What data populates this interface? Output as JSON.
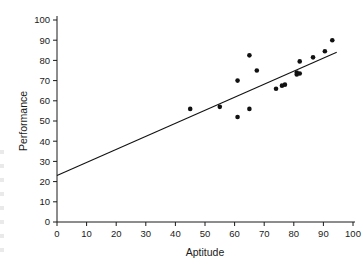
{
  "chart_data": {
    "type": "scatter",
    "title": "",
    "xlabel": "Aptitude",
    "ylabel": "Performance",
    "xlim": [
      0,
      100
    ],
    "ylim": [
      0,
      100
    ],
    "xticks": [
      0,
      10,
      20,
      30,
      40,
      50,
      60,
      70,
      80,
      90,
      100
    ],
    "yticks": [
      0,
      10,
      20,
      30,
      40,
      50,
      60,
      70,
      80,
      90,
      100
    ],
    "grid": false,
    "legend": null,
    "marker_color": "#111111",
    "line_color": "#111111",
    "points": [
      {
        "x": 45.0,
        "y": 56.0
      },
      {
        "x": 55.0,
        "y": 57.0
      },
      {
        "x": 61.0,
        "y": 70.0
      },
      {
        "x": 61.0,
        "y": 52.0
      },
      {
        "x": 65.0,
        "y": 56.0
      },
      {
        "x": 65.0,
        "y": 82.5
      },
      {
        "x": 67.5,
        "y": 75.0
      },
      {
        "x": 74.0,
        "y": 66.0
      },
      {
        "x": 76.0,
        "y": 67.5
      },
      {
        "x": 77.0,
        "y": 68.0
      },
      {
        "x": 81.0,
        "y": 74.0
      },
      {
        "x": 81.0,
        "y": 73.0
      },
      {
        "x": 82.0,
        "y": 73.5
      },
      {
        "x": 82.0,
        "y": 79.5
      },
      {
        "x": 86.5,
        "y": 81.5
      },
      {
        "x": 90.5,
        "y": 84.5
      },
      {
        "x": 93.0,
        "y": 90.0
      }
    ],
    "fit_line": {
      "x0": 0.0,
      "y0": 23.0,
      "x1": 94.5,
      "y1": 84.0
    }
  }
}
